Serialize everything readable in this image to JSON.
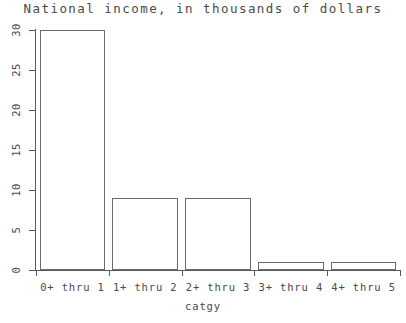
{
  "chart_data": {
    "type": "bar",
    "title": "National income, in thousands of dollars",
    "xlabel": "catgy",
    "ylabel": "",
    "categories": [
      "0+ thru 1",
      "1+ thru 2",
      "2+ thru 3",
      "3+ thru 4",
      "4+ thru 5"
    ],
    "values": [
      30,
      9,
      9,
      1,
      1
    ],
    "ylim": [
      0,
      30
    ],
    "yticks": [
      0,
      5,
      10,
      15,
      20,
      25,
      30
    ],
    "ytick_labels": [
      "0",
      "5",
      "10",
      "15",
      "20",
      "25",
      "30"
    ],
    "grid": false,
    "legend": null,
    "bar_style": {
      "fill": "none",
      "edge_color": "#6b6b6b",
      "background": "#ffffff"
    }
  }
}
